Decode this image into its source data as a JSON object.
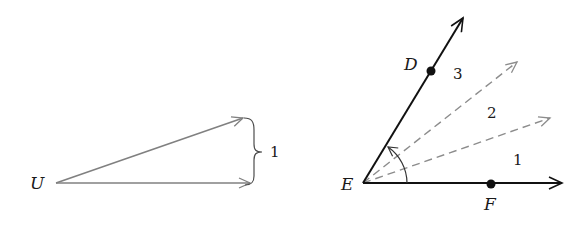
{
  "left_figure": {
    "origin_label": "U",
    "brace_label": "1",
    "vector_color": "#808080",
    "brace_color": "#4d4d4d"
  },
  "right_figure": {
    "vertex_label": "E",
    "point_d_label": "D",
    "point_f_label": "F",
    "region_labels": [
      "1",
      "2",
      "3"
    ],
    "solid_ray_color": "#111111",
    "dashed_ray_color": "#8c8c8c",
    "arc_color": "#333333"
  }
}
